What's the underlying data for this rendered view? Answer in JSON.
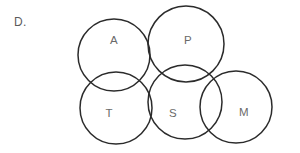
{
  "figure": {
    "panel_label": "D.",
    "background_color": "#ffffff",
    "stroke_color": "#2b2b2b",
    "label_color": "#6a6a6a"
  },
  "chart_data": {
    "type": "diagram",
    "subtype": "venn-euler-circles",
    "title": "D.",
    "circles": [
      {
        "id": "A",
        "label": "A",
        "cx": 114,
        "cy": 55,
        "r": 36,
        "label_x": 114,
        "label_y": 41
      },
      {
        "id": "P",
        "label": "P",
        "cx": 186,
        "cy": 44,
        "r": 38,
        "label_x": 188,
        "label_y": 41
      },
      {
        "id": "T",
        "label": "T",
        "cx": 116,
        "cy": 108,
        "r": 36,
        "label_x": 109,
        "label_y": 114
      },
      {
        "id": "S",
        "label": "S",
        "cx": 185,
        "cy": 102,
        "r": 37,
        "label_x": 173,
        "label_y": 114
      },
      {
        "id": "M",
        "label": "M",
        "cx": 236,
        "cy": 107,
        "r": 36,
        "label_x": 244,
        "label_y": 113
      }
    ],
    "overlaps": [
      [
        "A",
        "P"
      ],
      [
        "A",
        "T"
      ],
      [
        "P",
        "S"
      ],
      [
        "T",
        "S"
      ],
      [
        "S",
        "M"
      ]
    ],
    "legend": [],
    "annotations": []
  }
}
